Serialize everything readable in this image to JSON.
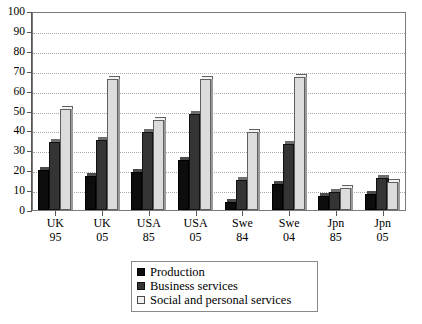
{
  "chart_data": {
    "type": "bar",
    "title": "",
    "subtitle": "",
    "xlabel": "",
    "ylabel": "",
    "ylim": [
      0,
      100
    ],
    "ytick_step": 10,
    "yticks": [
      "0",
      "10",
      "20",
      "30",
      "40",
      "50",
      "60",
      "70",
      "80",
      "90",
      "100"
    ],
    "grid": true,
    "grid_axis": "y",
    "legend_position": "bottom-center",
    "categories": [
      "UK 95",
      "UK 05",
      "USA 85",
      "USA 05",
      "Swe 84",
      "Swe 04",
      "Jpn 85",
      "Jpn 05"
    ],
    "category_lines": [
      {
        "line1": "UK",
        "line2": "95"
      },
      {
        "line1": "UK",
        "line2": "05"
      },
      {
        "line1": "USA",
        "line2": "85"
      },
      {
        "line1": "USA",
        "line2": "05"
      },
      {
        "line1": "Swe",
        "line2": "84"
      },
      {
        "line1": "Swe",
        "line2": "04"
      },
      {
        "line1": "Jpn",
        "line2": "85"
      },
      {
        "line1": "Jpn",
        "line2": "05"
      }
    ],
    "series": [
      {
        "name": "Production",
        "color": "#0d0d0d",
        "values": [
          20,
          17,
          19,
          25,
          4,
          13,
          7,
          8
        ]
      },
      {
        "name": "Business services",
        "color": "#343434",
        "values": [
          34,
          35,
          39,
          48,
          15,
          33,
          9,
          16
        ]
      },
      {
        "name": "Social and personal services",
        "color": "#dcdcdc",
        "values": [
          51,
          66,
          45,
          66,
          39,
          67,
          11,
          14
        ]
      }
    ]
  },
  "legend": {
    "items": [
      {
        "label": "Production"
      },
      {
        "label": "Business services"
      },
      {
        "label": "Social and personal services"
      }
    ]
  }
}
